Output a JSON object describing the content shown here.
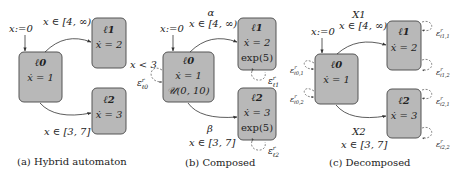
{
  "panels": [
    {
      "caption": "(a) Hybrid automaton",
      "init_label": "x:=0",
      "locations": [
        {
          "name": "ℓ0",
          "flow": "ẋ = 1"
        },
        {
          "name": "ℓ1",
          "flow": "ẋ = 2"
        },
        {
          "name": "ℓ2",
          "flow": "ẋ = 3"
        }
      ],
      "edges": [
        {
          "from": "ℓ0",
          "to": "ℓ1",
          "guard": "x ∈ [4, ∞)"
        },
        {
          "from": "ℓ0",
          "to": "ℓ2",
          "guard": "x ∈ [3, 7]"
        }
      ]
    },
    {
      "caption": "(b) Composed",
      "init_label": "x:=0",
      "locations": [
        {
          "name": "ℓ0",
          "flow": "ẋ = 1",
          "dist": "𝒰(0, 10)"
        },
        {
          "name": "ℓ1",
          "flow": "ẋ = 2",
          "dist": "exp(5)"
        },
        {
          "name": "ℓ2",
          "flow": "ẋ = 3",
          "dist": "exp(5)"
        }
      ],
      "edges": [
        {
          "from": "ℓ0",
          "to": "ℓ1",
          "action": "α",
          "guard": "x ∈ [4, ∞)"
        },
        {
          "from": "ℓ0",
          "to": "ℓ2",
          "action": "β",
          "guard": "x ∈ [3, 7]"
        }
      ],
      "self_loops": [
        {
          "loc": "ℓ0",
          "label": "ε",
          "sup": "r",
          "sub": "ℓ0",
          "guard": "x < 3"
        },
        {
          "loc": "ℓ1",
          "label": "ε",
          "sup": "r",
          "sub": "ℓ1"
        },
        {
          "loc": "ℓ2",
          "label": "ε",
          "sup": "r",
          "sub": "ℓ2"
        }
      ]
    },
    {
      "caption": "(c) Decomposed",
      "init_label": "x:=0",
      "locations": [
        {
          "name": "ℓ0",
          "flow": "ẋ = 1"
        },
        {
          "name": "ℓ1",
          "flow": "ẋ = 2"
        },
        {
          "name": "ℓ2",
          "flow": "ẋ = 3"
        }
      ],
      "edges": [
        {
          "from": "ℓ0",
          "to": "ℓ1",
          "action": "X1",
          "guard": "x ∈ [4, ∞)"
        },
        {
          "from": "ℓ0",
          "to": "ℓ2",
          "action": "X2",
          "guard": "x ∈ [3, 7]"
        }
      ],
      "self_loops": [
        {
          "loc": "ℓ0",
          "label": "ε",
          "sup": "r",
          "sub": "ℓ0,1"
        },
        {
          "loc": "ℓ0",
          "label": "ε",
          "sup": "r",
          "sub": "ℓ0,2"
        },
        {
          "loc": "ℓ1",
          "label": "ε",
          "sup": "r",
          "sub": "ℓ1,1"
        },
        {
          "loc": "ℓ1",
          "label": "ε",
          "sup": "r",
          "sub": "ℓ1,2"
        },
        {
          "loc": "ℓ2",
          "label": "ε",
          "sup": "r",
          "sub": "ℓ2,1"
        },
        {
          "loc": "ℓ2",
          "label": "ε",
          "sup": "r",
          "sub": "ℓ2,2"
        }
      ]
    }
  ]
}
